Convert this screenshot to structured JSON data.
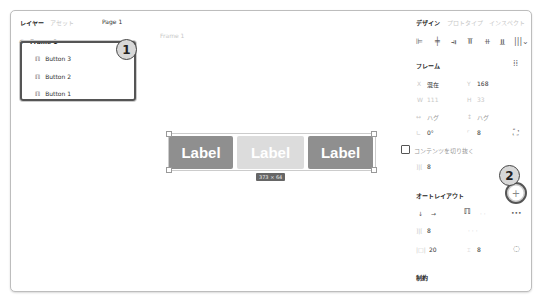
{
  "left_panel": {
    "tabs": [
      {
        "label": "レイヤー",
        "active": true
      },
      {
        "label": "アセット",
        "active": false
      }
    ],
    "page": "Page 1",
    "frame_name": "Frame 1",
    "layers": [
      {
        "label": "Button 3",
        "icon": "auto-layout-icon"
      },
      {
        "label": "Button 2",
        "icon": "auto-layout-icon"
      },
      {
        "label": "Button 1",
        "icon": "auto-layout-icon"
      }
    ],
    "callout": "1"
  },
  "canvas": {
    "frame_label": "Frame 1",
    "buttons": [
      {
        "label": "Label",
        "color": "#8f8f8f"
      },
      {
        "label": "Label",
        "color": "#dcdcdc"
      },
      {
        "label": "Label",
        "color": "#8f8f8f"
      }
    ],
    "size_badge": "373 × 64"
  },
  "right_panel": {
    "tabs": [
      {
        "label": "デザイン",
        "active": true
      },
      {
        "label": "プロトタイプ",
        "active": false
      },
      {
        "label": "インスペクト",
        "active": false
      }
    ],
    "frame_section": {
      "title": "フレーム",
      "x_label": "X",
      "x_value": "混在",
      "y_label": "Y",
      "y_value": "168",
      "w_label": "W",
      "w_value": "111",
      "h_label": "H",
      "h_value": "33",
      "w_resize": "ハグ",
      "h_resize": "ハグ",
      "rotation": "0°",
      "radius": "8",
      "clip_label": "コンテンツを切り抜く",
      "spacing": "8"
    },
    "auto_layout": {
      "title": "オートレイアウト",
      "callout": "2",
      "add_label": "+",
      "direction_down": "↓",
      "direction_right": "→",
      "more_label": "•••",
      "gap": "8",
      "padding_h": "20",
      "padding_v": "8"
    },
    "constraints_title": "制約"
  }
}
